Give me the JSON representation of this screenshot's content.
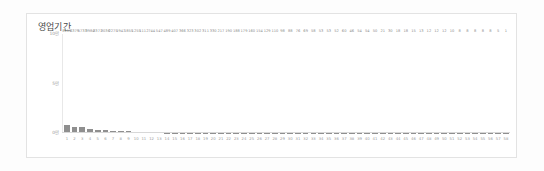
{
  "card": {
    "background": "#ffffff",
    "border_color": "#e3e3e3"
  },
  "chart_data": {
    "type": "bar",
    "title": "영업기간",
    "xlabel": "",
    "ylabel": "",
    "ylim": [
      0,
      100000
    ],
    "grid": false,
    "legend": null,
    "bar_color": "#8f8f8f",
    "y_ticks": [
      {
        "label": "10만",
        "value": 100000
      },
      {
        "label": "5만",
        "value": 50000
      },
      {
        "label": "0만",
        "value": 0
      }
    ],
    "categories": [
      "1",
      "2",
      "3",
      "4",
      "5",
      "6",
      "7",
      "8",
      "9",
      "10",
      "11",
      "12",
      "13",
      "14",
      "15",
      "16",
      "17",
      "18",
      "19",
      "20",
      "21",
      "22",
      "23",
      "24",
      "25",
      "26",
      "27",
      "28",
      "29",
      "30",
      "31",
      "32",
      "33",
      "34",
      "35",
      "36",
      "37",
      "38",
      "39",
      "40",
      "41",
      "42",
      "43",
      "44",
      "45",
      "46",
      "47",
      "48",
      "49",
      "50",
      "51",
      "52",
      "53",
      "54",
      "55",
      "56",
      "57",
      "58"
    ],
    "values": [
      8115,
      6379,
      5733,
      3984,
      3371,
      3036,
      2275,
      1947,
      1855,
      1255,
      1112,
      744,
      547,
      489,
      407,
      366,
      323,
      302,
      311,
      330,
      217,
      190,
      188,
      179,
      160,
      154,
      129,
      110,
      98,
      88,
      76,
      69,
      58,
      53,
      53,
      52,
      60,
      46,
      54,
      54,
      50,
      21,
      30,
      18,
      18,
      15,
      13,
      12,
      12,
      12,
      10,
      8,
      8,
      8,
      8,
      8,
      5,
      1
    ],
    "value_labels": [
      "8115",
      "6379",
      "5733",
      "3984",
      "3371",
      "3036",
      "2275",
      "1947",
      "1855",
      "1255",
      "1112",
      "744",
      "547",
      "489",
      "407",
      "366",
      "323",
      "302",
      "311",
      "330",
      "217",
      "190",
      "188",
      "179",
      "160",
      "154",
      "129",
      "110",
      "98",
      "88",
      "76",
      "69",
      "58",
      "53",
      "53",
      "52",
      "60",
      "46",
      "54",
      "54",
      "50",
      "21",
      "30",
      "18",
      "18",
      "15",
      "13",
      "12",
      "12",
      "12",
      "10",
      "8",
      "8",
      "8",
      "8",
      "8",
      "5",
      "1"
    ]
  }
}
